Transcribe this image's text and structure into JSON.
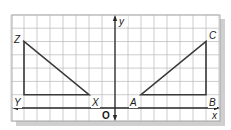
{
  "figure": {
    "grid": {
      "x_min": -8,
      "x_max": 8,
      "y_min": -1,
      "y_max": 7,
      "origin_px": [
        115,
        108
      ],
      "unit_x_px": 13,
      "unit_y_px": 13.3,
      "line_color": "#b8b8b8",
      "border_color": "#9a9a9a",
      "shadow_color": "#c8c8c8"
    },
    "axes": {
      "x_label": "x",
      "y_label": "y",
      "origin_label": "O",
      "color": "#2a2a2a"
    },
    "triangles": [
      {
        "name": "XYZ",
        "color": "#3a3a3a",
        "vertices": [
          {
            "label": "Z",
            "x": -7,
            "y": 5
          },
          {
            "label": "Y",
            "x": -7,
            "y": 1
          },
          {
            "label": "X",
            "x": -2,
            "y": 1
          }
        ]
      },
      {
        "name": "ABC",
        "color": "#3a3a3a",
        "vertices": [
          {
            "label": "A",
            "x": 2,
            "y": 1
          },
          {
            "label": "B",
            "x": 7,
            "y": 1
          },
          {
            "label": "C",
            "x": 7,
            "y": 5
          }
        ]
      }
    ],
    "labels": {
      "Z": "Z",
      "Y": "Y",
      "X": "X",
      "A": "A",
      "B": "B",
      "C": "C"
    }
  }
}
